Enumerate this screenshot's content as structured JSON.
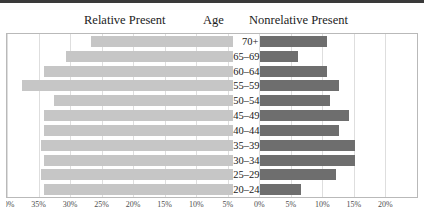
{
  "figure": {
    "headers": {
      "left": "Relative Present",
      "middle": "Age",
      "right": "Nonrelative Present"
    },
    "colors": {
      "left_bar": "#c6c6c6",
      "right_bar": "#6e6e6e",
      "gridline": "#dedede",
      "frame": "#b9b9b9",
      "rule": "#3a3a3a",
      "text": "#1a1a1a"
    }
  },
  "chart_data": {
    "type": "bar",
    "title": "",
    "subtitle": "",
    "orientation": "horizontal",
    "style": "population-pyramid",
    "xlabel": "",
    "ylabel": "Age",
    "grid": true,
    "legend_position": "top",
    "categories": [
      "70+",
      "65–69",
      "60–64",
      "55–59",
      "50–54",
      "45–49",
      "40–44",
      "35–39",
      "30–34",
      "25–29",
      "20–24"
    ],
    "series": [
      {
        "name": "Relative Present",
        "side": "left",
        "color": "#c6c6c6",
        "values": [
          22.5,
          26.5,
          30.0,
          33.5,
          28.5,
          30.0,
          30.0,
          30.5,
          30.0,
          30.5,
          30.0
        ]
      },
      {
        "name": "Nonrelative Present",
        "side": "right",
        "color": "#6e6e6e",
        "values": [
          10.5,
          6.0,
          10.5,
          12.5,
          11.0,
          14.0,
          12.5,
          15.0,
          15.0,
          12.0,
          6.5
        ]
      }
    ],
    "xlim": [
      -40,
      25
    ],
    "xticks": [
      -40,
      -35,
      -30,
      -25,
      -20,
      -15,
      -10,
      -5,
      0,
      5,
      10,
      15,
      20
    ],
    "xtick_labels": [
      "40%",
      "35%",
      "30%",
      "25%",
      "20%",
      "15%",
      "10%",
      "5%",
      "0%",
      "5%",
      "10%",
      "15%",
      "20%"
    ]
  }
}
